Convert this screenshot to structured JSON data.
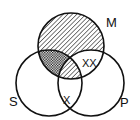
{
  "diagram": {
    "type": "venn-3-syllogism",
    "circles": [
      {
        "id": "M",
        "label": "M",
        "cx": 71,
        "cy": 46,
        "r": 33
      },
      {
        "id": "S",
        "label": "S",
        "cx": 49,
        "cy": 83,
        "r": 33
      },
      {
        "id": "P",
        "label": "P",
        "cx": 91,
        "cy": 83,
        "r": 33
      }
    ],
    "regions": {
      "M_only": "diagonal-hatch",
      "M_and_S_not_P": "cross-hatch",
      "M_and_S_and_P": "diagonal-hatch",
      "M_and_P_not_S": "empty"
    },
    "marks": {
      "m_p_region": "XX",
      "s_p_boundary": "X"
    },
    "colors": {
      "stroke": "#111111",
      "background": "#ffffff"
    }
  }
}
